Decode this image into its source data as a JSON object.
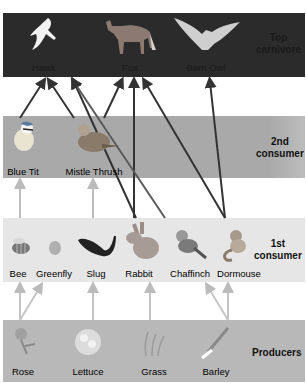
{
  "levels": {
    "top": {
      "label_line1": "Top",
      "label_line2": "carnivore",
      "color": "#2b2b2b"
    },
    "second": {
      "label_line1": "2nd",
      "label_line2": "consumer",
      "color": "#a9a9a9"
    },
    "first": {
      "label_line1": "1st",
      "label_line2": "consumer",
      "color": "#e6e6e6"
    },
    "producers": {
      "label": "Producers",
      "color": "#b8b8b8"
    }
  },
  "organisms": {
    "top": [
      {
        "name": "Hawk",
        "icon": "hawk-icon"
      },
      {
        "name": "Fox",
        "icon": "fox-icon"
      },
      {
        "name": "Barn Owl",
        "icon": "barn-owl-icon"
      }
    ],
    "second": [
      {
        "name": "Blue Tit",
        "icon": "blue-tit-icon"
      },
      {
        "name": "Mistle Thrush",
        "icon": "mistle-thrush-icon"
      }
    ],
    "first": [
      {
        "name": "Bee",
        "icon": "bee-icon"
      },
      {
        "name": "Greenfly",
        "icon": "greenfly-icon"
      },
      {
        "name": "Slug",
        "icon": "slug-icon"
      },
      {
        "name": "Rabbit",
        "icon": "rabbit-icon"
      },
      {
        "name": "Chaffinch",
        "icon": "chaffinch-icon"
      },
      {
        "name": "Dormouse",
        "icon": "dormouse-icon"
      }
    ],
    "producers": [
      {
        "name": "Rose",
        "icon": "rose-icon"
      },
      {
        "name": "Lettuce",
        "icon": "lettuce-icon"
      },
      {
        "name": "Grass",
        "icon": "grass-icon"
      },
      {
        "name": "Barley",
        "icon": "barley-icon"
      }
    ]
  },
  "links": [
    {
      "from": "Rose",
      "to": "Bee"
    },
    {
      "from": "Rose",
      "to": "Greenfly"
    },
    {
      "from": "Lettuce",
      "to": "Slug"
    },
    {
      "from": "Grass",
      "to": "Rabbit"
    },
    {
      "from": "Barley",
      "to": "Chaffinch"
    },
    {
      "from": "Barley",
      "to": "Dormouse"
    },
    {
      "from": "Bee",
      "to": "Blue Tit"
    },
    {
      "from": "Slug",
      "to": "Mistle Thrush"
    },
    {
      "from": "Rabbit",
      "to": "Hawk"
    },
    {
      "from": "Rabbit",
      "to": "Fox"
    },
    {
      "from": "Chaffinch",
      "to": "Hawk"
    },
    {
      "from": "Dormouse",
      "to": "Fox"
    },
    {
      "from": "Dormouse",
      "to": "Barn Owl"
    },
    {
      "from": "Blue Tit",
      "to": "Hawk"
    },
    {
      "from": "Mistle Thrush",
      "to": "Hawk"
    },
    {
      "from": "Mistle Thrush",
      "to": "Fox"
    }
  ]
}
